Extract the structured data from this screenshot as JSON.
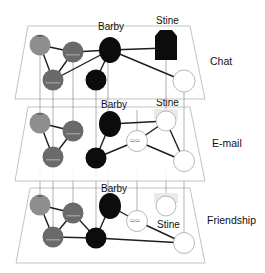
{
  "diagram": {
    "type": "multiplex-network",
    "layers": [
      {
        "name": "Chat",
        "label": "Chat"
      },
      {
        "name": "E-mail",
        "label": "E-mail"
      },
      {
        "name": "Friendship",
        "label": "Friendship"
      }
    ],
    "node_labels": {
      "chat_barby": "Barby",
      "chat_stine": "Stine",
      "email_barby": "Barby",
      "email_stine": "Stine",
      "friend_barby": "Barby",
      "friend_stine": "Stine"
    },
    "colors": {
      "grey_light": "#8e8e8e",
      "grey_dark": "#6a6a6a",
      "black": "#0c0c0c",
      "white": "#ffffff",
      "ghost": "#e6e6e6"
    }
  }
}
